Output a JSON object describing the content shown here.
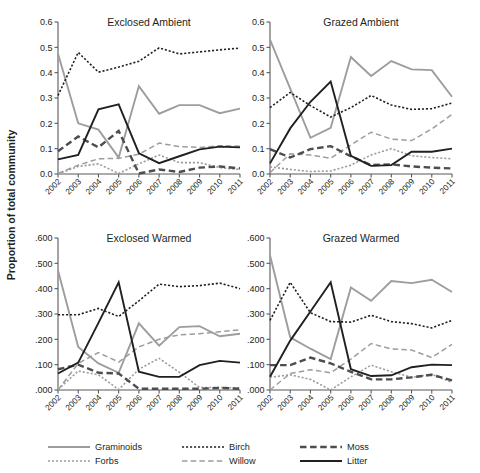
{
  "figure": {
    "ylabel": "Proportion of total community",
    "width": 480,
    "height": 473
  },
  "legend": {
    "position": "bottom",
    "items": [
      {
        "label": "Graminoids",
        "color": "#9d9d9d",
        "style": "solid",
        "width": 1.9
      },
      {
        "label": "Forbs",
        "color": "#9d9d9d",
        "style": "dotted",
        "width": 1.6
      },
      {
        "label": "Birch",
        "color": "#231f20",
        "style": "dotted",
        "width": 1.6
      },
      {
        "label": "Willow",
        "color": "#9d9d9d",
        "style": "dashed",
        "width": 1.5
      },
      {
        "label": "Moss",
        "color": "#4d4d4f",
        "style": "dashed-thick",
        "width": 2.4
      },
      {
        "label": "Litter",
        "color": "#231f20",
        "style": "solid",
        "width": 1.9
      }
    ]
  },
  "chart_data": {
    "type": "line",
    "title": "",
    "xlabel": "",
    "ylabel": "Proportion of total community",
    "x": [
      2002,
      2003,
      2004,
      2005,
      2006,
      2007,
      2008,
      2009,
      2010,
      2011
    ],
    "xtick_labels": [
      "2002",
      "2003",
      "2004",
      "2005",
      "2006",
      "2007",
      "2008",
      "2009",
      "2010",
      "2011"
    ],
    "grid": false,
    "legend_position": "bottom",
    "panels": [
      {
        "title": "Exclosed Ambient",
        "row": 0,
        "col": 0,
        "ylim": [
          0.0,
          0.6
        ],
        "yticks": [
          0.0,
          0.1,
          0.2,
          0.3,
          0.4,
          0.5,
          0.6
        ],
        "ytick_labels": [
          "0.0",
          "0.1",
          "0.2",
          "0.3",
          "0.4",
          "0.5",
          "0.6"
        ],
        "series": [
          {
            "name": "Graminoids",
            "values": [
              0.475,
              0.2,
              0.175,
              0.065,
              0.347,
              0.238,
              0.272,
              0.272,
              0.24,
              0.258
            ]
          },
          {
            "name": "Forbs",
            "values": [
              0.0,
              0.03,
              0.04,
              0.002,
              0.04,
              0.075,
              0.045,
              0.045,
              0.025,
              0.018
            ]
          },
          {
            "name": "Birch",
            "values": [
              0.31,
              0.48,
              0.402,
              0.422,
              0.445,
              0.498,
              0.474,
              0.482,
              0.49,
              0.497
            ]
          },
          {
            "name": "Willow",
            "values": [
              0.002,
              0.035,
              0.06,
              0.062,
              0.078,
              0.122,
              0.108,
              0.105,
              0.112,
              0.11
            ]
          },
          {
            "name": "Moss",
            "values": [
              0.09,
              0.148,
              0.105,
              0.17,
              0.002,
              0.018,
              0.008,
              0.025,
              0.03,
              0.022
            ]
          },
          {
            "name": "Litter",
            "values": [
              0.058,
              0.075,
              0.255,
              0.275,
              0.082,
              0.043,
              0.07,
              0.097,
              0.108,
              0.105
            ]
          }
        ]
      },
      {
        "title": "Grazed Ambient",
        "row": 0,
        "col": 1,
        "ylim": [
          0.0,
          0.6
        ],
        "yticks": [
          0.0,
          0.1,
          0.2,
          0.3,
          0.4,
          0.5,
          0.6
        ],
        "ytick_labels": [
          "0.0",
          "0.1",
          "0.2",
          "0.3",
          "0.4",
          "0.5",
          "0.6"
        ],
        "series": [
          {
            "name": "Graminoids",
            "values": [
              0.53,
              0.337,
              0.143,
              0.182,
              0.462,
              0.387,
              0.446,
              0.413,
              0.41,
              0.305
            ]
          },
          {
            "name": "Forbs",
            "values": [
              0.028,
              0.018,
              0.01,
              0.012,
              0.035,
              0.075,
              0.1,
              0.072,
              0.065,
              0.06
            ]
          },
          {
            "name": "Birch",
            "values": [
              0.262,
              0.322,
              0.27,
              0.225,
              0.262,
              0.31,
              0.272,
              0.255,
              0.258,
              0.28
            ]
          },
          {
            "name": "Willow",
            "values": [
              0.005,
              0.08,
              0.075,
              0.062,
              0.115,
              0.165,
              0.138,
              0.132,
              0.178,
              0.235
            ]
          },
          {
            "name": "Moss",
            "values": [
              0.098,
              0.065,
              0.098,
              0.11,
              0.07,
              0.035,
              0.038,
              0.03,
              0.025,
              0.022
            ]
          },
          {
            "name": "Litter",
            "values": [
              0.042,
              0.18,
              0.285,
              0.365,
              0.072,
              0.032,
              0.035,
              0.088,
              0.088,
              0.1
            ]
          }
        ]
      },
      {
        "title": "Exclosed Warmed",
        "row": 1,
        "col": 0,
        "ylim": [
          0.0,
          0.6
        ],
        "yticks": [
          0.0,
          0.1,
          0.2,
          0.3,
          0.4,
          0.5,
          0.6
        ],
        "ytick_labels": [
          ".000",
          ".100",
          ".200",
          ".300",
          ".400",
          ".500",
          ".600"
        ],
        "series": [
          {
            "name": "Graminoids",
            "values": [
              0.472,
              0.17,
              0.105,
              0.068,
              0.263,
              0.175,
              0.248,
              0.252,
              0.212,
              0.222
            ]
          },
          {
            "name": "Forbs",
            "values": [
              0.002,
              0.075,
              0.06,
              0.002,
              0.082,
              0.125,
              0.07,
              0.01,
              0.01,
              0.008
            ]
          },
          {
            "name": "Birch",
            "values": [
              0.297,
              0.297,
              0.322,
              0.29,
              0.352,
              0.418,
              0.408,
              0.412,
              0.422,
              0.4
            ]
          },
          {
            "name": "Willow",
            "values": [
              0.0,
              0.105,
              0.148,
              0.11,
              0.17,
              0.2,
              0.218,
              0.222,
              0.23,
              0.238
            ]
          },
          {
            "name": "Moss",
            "values": [
              0.082,
              0.1,
              0.068,
              0.065,
              0.005,
              0.005,
              0.005,
              0.005,
              0.008,
              0.005
            ]
          },
          {
            "name": "Litter",
            "values": [
              0.065,
              0.108,
              0.265,
              0.425,
              0.072,
              0.052,
              0.052,
              0.098,
              0.115,
              0.108
            ]
          }
        ]
      },
      {
        "title": "Grazed Warmed",
        "row": 1,
        "col": 1,
        "ylim": [
          0.0,
          0.6
        ],
        "yticks": [
          0.0,
          0.1,
          0.2,
          0.3,
          0.4,
          0.5,
          0.6
        ],
        "ytick_labels": [
          ".000",
          ".100",
          ".200",
          ".300",
          ".400",
          ".500",
          ".600"
        ],
        "series": [
          {
            "name": "Graminoids",
            "values": [
              0.532,
              0.208,
              0.163,
              0.122,
              0.405,
              0.352,
              0.43,
              0.422,
              0.435,
              0.387
            ]
          },
          {
            "name": "Forbs",
            "values": [
              0.05,
              0.06,
              0.042,
              0.0,
              0.052,
              0.098,
              0.072,
              0.05,
              0.062,
              0.03
            ]
          },
          {
            "name": "Birch",
            "values": [
              0.275,
              0.425,
              0.305,
              0.27,
              0.268,
              0.295,
              0.27,
              0.262,
              0.245,
              0.275
            ]
          },
          {
            "name": "Willow",
            "values": [
              0.0,
              0.065,
              0.08,
              0.068,
              0.122,
              0.183,
              0.162,
              0.158,
              0.128,
              0.18
            ]
          },
          {
            "name": "Moss",
            "values": [
              0.098,
              0.098,
              0.128,
              0.105,
              0.072,
              0.042,
              0.042,
              0.05,
              0.06,
              0.038
            ]
          },
          {
            "name": "Litter",
            "values": [
              0.052,
              0.195,
              0.31,
              0.425,
              0.082,
              0.055,
              0.058,
              0.09,
              0.1,
              0.098
            ]
          }
        ]
      }
    ]
  }
}
